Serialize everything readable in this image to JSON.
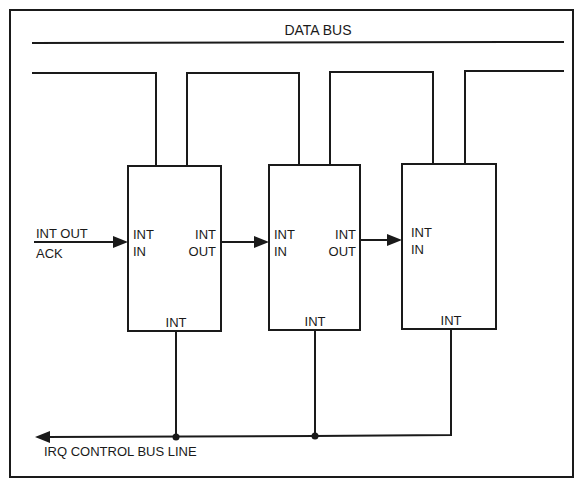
{
  "diagram": {
    "data_bus_label": "DATA BUS",
    "irq_label": "IRQ CONTROL BUS LINE",
    "input": {
      "line1": "INT OUT",
      "line2": "ACK"
    },
    "devices": [
      {
        "int_in_line1": "INT",
        "int_in_line2": "IN",
        "int_out_line1": "INT",
        "int_out_line2": "OUT",
        "int_bottom": "INT"
      },
      {
        "int_in_line1": "INT",
        "int_in_line2": "IN",
        "int_out_line1": "INT",
        "int_out_line2": "OUT",
        "int_bottom": "INT"
      },
      {
        "int_in_line1": "INT",
        "int_in_line2": "IN",
        "int_bottom": "INT"
      }
    ],
    "colors": {
      "ink": "#1a1a1a",
      "background": "#ffffff"
    }
  }
}
